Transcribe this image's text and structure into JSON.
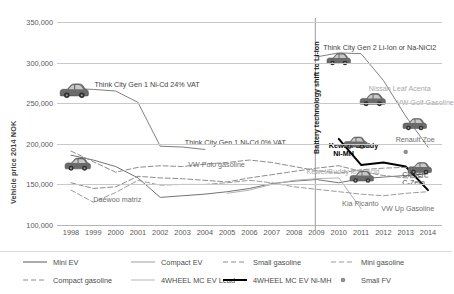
{
  "chart_data": {
    "type": "line",
    "title": "",
    "xlabel": "",
    "ylabel": "Vehicle price 2014 NOK",
    "x": [
      1998,
      1999,
      2000,
      2001,
      2002,
      2003,
      2004,
      2005,
      2006,
      2007,
      2008,
      2009,
      2010,
      2011,
      2012,
      2013,
      2014
    ],
    "xlim": [
      1998,
      2014
    ],
    "ylim": [
      100000,
      350000
    ],
    "y_ticks": [
      "100,000",
      "150,000",
      "200,000",
      "250,000",
      "300,000",
      "350,000"
    ],
    "y_tick_values": [
      100000,
      150000,
      200000,
      250000,
      300000,
      350000
    ],
    "x_tick_labels": [
      "1998",
      "1999",
      "2000",
      "2001",
      "2002",
      "2003",
      "2004",
      "2005",
      "2006",
      "2007",
      "2008",
      "2009",
      "2010",
      "2011",
      "2012",
      "2013",
      "2014"
    ],
    "grid": "horizontal",
    "legend_position": "bottom",
    "series": [
      {
        "name": "Compact EV",
        "style": "solid",
        "color": "#808080",
        "width": 1.0,
        "x": [
          1998,
          1999,
          2000,
          2001,
          2002,
          2003,
          2004,
          2005,
          2006,
          2007,
          2008,
          2009,
          2010,
          2011,
          2012,
          2013,
          2014
        ],
        "values": [
          268000,
          267000,
          265000,
          251000,
          197000,
          196000,
          193000,
          null,
          null,
          null,
          null,
          307000,
          312000,
          311000,
          278000,
          234000,
          196000
        ]
      },
      {
        "name": "Mini EV",
        "style": "solid",
        "color": "#737373",
        "width": 1.0,
        "x": [
          1998,
          1999,
          2000,
          2001,
          2002,
          2003,
          2004,
          2005,
          2006,
          2007,
          2008,
          2009,
          2010,
          2011,
          2012,
          2013,
          2014
        ],
        "values": [
          186000,
          180000,
          172000,
          158000,
          134000,
          136000,
          138000,
          141000,
          145000,
          151000,
          154000,
          156000,
          152000,
          157000,
          159000,
          161000,
          163000
        ]
      },
      {
        "name": "4WHEEL MC EV Lead",
        "style": "solid",
        "color": "#b3b3b3",
        "width": 1.0,
        "x": [
          1998,
          1999,
          2000,
          2001,
          2002,
          2003,
          2004,
          2005,
          2006,
          2007,
          2008,
          2009,
          2010,
          2011,
          2012,
          2013,
          2014
        ],
        "values": [
          null,
          null,
          null,
          null,
          null,
          null,
          null,
          139000,
          143000,
          150000,
          155000,
          157000,
          158000,
          120000,
          null,
          null,
          null
        ]
      },
      {
        "name": "4WHEEL MC EV Ni-MH",
        "style": "solid",
        "color": "#000000",
        "width": 2.0,
        "x": [
          1998,
          1999,
          2000,
          2001,
          2002,
          2003,
          2004,
          2005,
          2006,
          2007,
          2008,
          2009,
          2010,
          2011,
          2012,
          2013,
          2014
        ],
        "values": [
          null,
          null,
          null,
          null,
          null,
          null,
          null,
          null,
          null,
          null,
          null,
          null,
          206000,
          174000,
          177000,
          172000,
          143000
        ]
      },
      {
        "name": "Compact gasoline",
        "style": "dashed",
        "color": "#8c8c8c",
        "width": 1.0,
        "x": [
          1998,
          1999,
          2000,
          2001,
          2002,
          2003,
          2004,
          2005,
          2006,
          2007,
          2008,
          2009,
          2010,
          2011,
          2012,
          2013,
          2014
        ],
        "values": [
          191000,
          178000,
          165000,
          171000,
          173000,
          172000,
          175000,
          177000,
          180000,
          177000,
          172000,
          167000,
          164000,
          168000,
          170000,
          171000,
          172000
        ]
      },
      {
        "name": "Small gasoline",
        "style": "dashed",
        "color": "#8c8c8c",
        "width": 1.0,
        "x": [
          1998,
          1999,
          2000,
          2001,
          2002,
          2003,
          2004,
          2005,
          2006,
          2007,
          2008,
          2009,
          2010,
          2011,
          2012,
          2013,
          2014
        ],
        "values": [
          152000,
          145000,
          147000,
          160000,
          158000,
          157000,
          155000,
          153000,
          158000,
          162000,
          166000,
          170000,
          173000,
          166000,
          161000,
          158000,
          159000
        ]
      },
      {
        "name": "Mini gasoline",
        "style": "dashed",
        "color": "#9c9c9c",
        "width": 1.0,
        "x": [
          1998,
          1999,
          2000,
          2001,
          2002,
          2003,
          2004,
          2005,
          2006,
          2007,
          2008,
          2009,
          2010,
          2011,
          2012,
          2013,
          2014
        ],
        "values": [
          143000,
          128000,
          140000,
          155000,
          149000,
          150000,
          150000,
          152000,
          155000,
          152000,
          147000,
          144000,
          141000,
          138000,
          136000,
          139000,
          141000
        ]
      },
      {
        "name": "Small FV",
        "style": "marker",
        "color": "#8c8c8c",
        "width": 1.0,
        "x": [
          2013
        ],
        "values": [
          190000
        ]
      }
    ],
    "annotations": [
      {
        "text": "Think City Gen 1 Ni-Cd 24% VAT",
        "x": 1999.05,
        "y": 272000,
        "tone": "dark"
      },
      {
        "text": "Think City Gen 1 Ni-Cd 0% VAT",
        "x": 2003.1,
        "y": 201000,
        "tone": "dark"
      },
      {
        "text": "Think City Gen 2 Li-Ion or Na-NiCl2",
        "x": 2009.3,
        "y": 318000,
        "tone": "dark"
      },
      {
        "text": "Nissan Leaf Acenta",
        "x": 2011.35,
        "y": 268000,
        "tone": "light"
      },
      {
        "text": "VW Golf Gasoline",
        "x": 2012.6,
        "y": 250000,
        "tone": "light"
      },
      {
        "text": "Renault Zoe",
        "x": 2012.55,
        "y": 205000,
        "tone": "mid"
      },
      {
        "text": "Citroen",
        "x": 2012.85,
        "y": 161000,
        "tone": "dark"
      },
      {
        "text": "C-Zero",
        "x": 2012.85,
        "y": 152000,
        "tone": "dark"
      },
      {
        "text": "Kewet / Buddy",
        "x": 2009.55,
        "y": 197000,
        "tone": "bold"
      },
      {
        "text": "Ni-MH",
        "x": 2009.75,
        "y": 188000,
        "tone": "bold"
      },
      {
        "text": "Kewet/Buddy lead acid",
        "x": 2008.55,
        "y": 165000,
        "tone": "light"
      },
      {
        "text": "VW Polo gasoline",
        "x": 2003.25,
        "y": 174000,
        "tone": "mid"
      },
      {
        "text": "Daewoo matriz",
        "x": 1999.0,
        "y": 131000,
        "tone": "mid"
      },
      {
        "text": "Kia Picanto",
        "x": 2010.15,
        "y": 126000,
        "tone": "mid"
      },
      {
        "text": "VW Up Gasoline",
        "x": 2011.9,
        "y": 120000,
        "tone": "mid"
      }
    ],
    "vertical_annotation": {
      "text": "Battery technology shift to Li-Ion",
      "x": 2008.95
    },
    "car_icons": [
      {
        "name": "car-icon-think-city-gen1",
        "x": 1998.15,
        "y": 266000,
        "w": 30,
        "h": 17
      },
      {
        "name": "car-icon-mini-ev-1998",
        "x": 1998.3,
        "y": 175000,
        "w": 27,
        "h": 16
      },
      {
        "name": "car-icon-think-city-gen2",
        "x": 2010.0,
        "y": 304000,
        "w": 25,
        "h": 14
      },
      {
        "name": "car-icon-nissan-leaf",
        "x": 2011.5,
        "y": 254000,
        "w": 29,
        "h": 15
      },
      {
        "name": "car-icon-renault-zoe",
        "x": 2013.4,
        "y": 224000,
        "w": 27,
        "h": 14
      },
      {
        "name": "car-icon-kewet-buddy-nimh",
        "x": 2010.75,
        "y": 202000,
        "w": 25,
        "h": 15
      },
      {
        "name": "car-icon-citroen-czero",
        "x": 2013.6,
        "y": 170000,
        "w": 25,
        "h": 14
      },
      {
        "name": "car-icon-kewet-buddy-lead",
        "x": 2011.0,
        "y": 160000,
        "w": 25,
        "h": 15
      }
    ]
  },
  "legend": {
    "row1": [
      {
        "label": "Mini EV",
        "marker": "line-solid",
        "color": "#737373",
        "width": 1.2
      },
      {
        "label": "Compact EV",
        "marker": "line-solid",
        "color": "#b0b0b0",
        "width": 1.2
      },
      {
        "label": "Small gasoline",
        "marker": "line-dashed",
        "color": "#8c8c8c",
        "width": 1.0
      },
      {
        "label": "Mini gasoline",
        "marker": "line-dashed",
        "color": "#9c9c9c",
        "width": 1.0
      }
    ],
    "row2": [
      {
        "label": "Compact gasoline",
        "marker": "line-dashed",
        "color": "#8c8c8c",
        "width": 1.0
      },
      {
        "label": "4WHEEL MC EV Lead",
        "marker": "line-solid",
        "color": "#c4c4c4",
        "width": 1.2
      },
      {
        "label": "4WHEEL MC EV Ni-MH",
        "marker": "line-solid",
        "color": "#000000",
        "width": 2.0
      },
      {
        "label": "Small FV",
        "marker": "dot",
        "color": "#8c8c8c",
        "width": 1.0
      }
    ]
  }
}
